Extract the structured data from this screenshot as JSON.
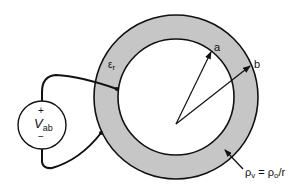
{
  "diagram": {
    "labels": {
      "permittivity_symbol": "ε",
      "permittivity_sub": "r",
      "inner_radius": "a",
      "outer_radius": "b",
      "source_plus": "+",
      "source_minus": "−",
      "source_symbol": "V",
      "source_sub": "ab",
      "charge_rho": "ρ",
      "charge_rho_sub": "v",
      "charge_eq": " = ρ",
      "charge_rho0_sub": "o",
      "charge_div": "/r"
    },
    "colors": {
      "shell_fill": "#c8c8c8",
      "stroke": "#111111",
      "background": "#ffffff"
    },
    "geometry": {
      "center": [
        176,
        97
      ],
      "inner_radius_px": 58,
      "outer_radius_px": 82,
      "source_center": [
        42,
        125
      ],
      "source_radius_px": 24
    }
  }
}
